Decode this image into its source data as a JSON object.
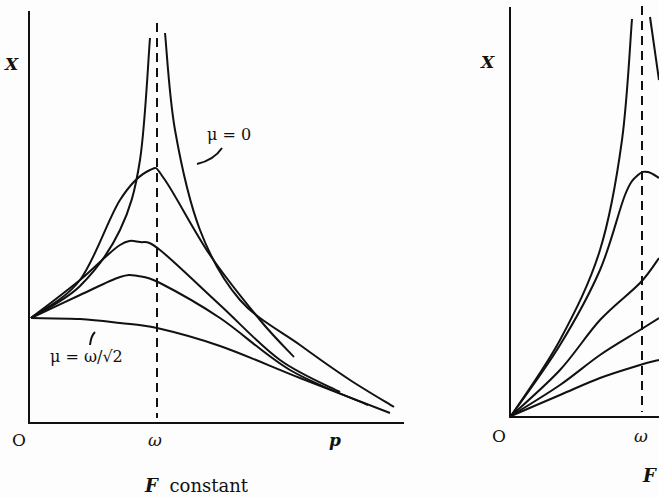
{
  "chart_data": [
    {
      "type": "line",
      "title": "",
      "caption": "F constant",
      "xlabel": "p",
      "ylabel": "X",
      "origin_label": "O",
      "x_ticks": [
        {
          "label": "ω",
          "position": "resonance"
        }
      ],
      "grid": false,
      "legend": "none",
      "annotations": [
        {
          "text": "μ = 0",
          "target": "outermost curve (undamped, diverges at p = ω)"
        },
        {
          "text": "μ = ω/√2",
          "target": "lowest curve (monotonically decreasing)"
        }
      ],
      "reference_lines": [
        {
          "type": "vertical",
          "style": "dashed",
          "at": "ω"
        }
      ],
      "series": [
        {
          "name": "μ = 0",
          "description": "diverges to infinity at p = ω; two branches",
          "points_left": [
            [
              31,
              318
            ],
            [
              80,
              286
            ],
            [
              120,
              230
            ],
            [
              140,
              160
            ],
            [
              150,
              38
            ]
          ],
          "points_right": [
            [
              165,
              33
            ],
            [
              175,
              130
            ],
            [
              200,
              230
            ],
            [
              240,
              300
            ],
            [
              300,
              345
            ],
            [
              350,
              380
            ],
            [
              394,
              407
            ]
          ]
        },
        {
          "name": "μ small",
          "points": [
            [
              31,
              318
            ],
            [
              80,
              280
            ],
            [
              120,
              200
            ],
            [
              150,
              170
            ],
            [
              165,
              180
            ],
            [
              210,
              255
            ],
            [
              260,
              320
            ],
            [
              294,
              357
            ]
          ]
        },
        {
          "name": "μ medium",
          "points": [
            [
              31,
              318
            ],
            [
              80,
              280
            ],
            [
              120,
              245
            ],
            [
              140,
              242
            ],
            [
              160,
              250
            ],
            [
              220,
              305
            ],
            [
              280,
              360
            ],
            [
              340,
              392
            ]
          ]
        },
        {
          "name": "μ larger",
          "points": [
            [
              31,
              318
            ],
            [
              80,
              295
            ],
            [
              120,
              277
            ],
            [
              138,
              276
            ],
            [
              160,
              283
            ],
            [
              220,
              318
            ],
            [
              290,
              370
            ],
            [
              368,
              405
            ]
          ]
        },
        {
          "name": "μ = ω/√2",
          "points": [
            [
              31,
              318
            ],
            [
              80,
              319
            ],
            [
              120,
              323
            ],
            [
              157,
              328
            ],
            [
              220,
              346
            ],
            [
              300,
              378
            ],
            [
              390,
              413
            ]
          ]
        }
      ]
    },
    {
      "type": "line",
      "title": "",
      "caption": "F",
      "ylabel": "X",
      "origin_label": "O",
      "x_ticks": [
        {
          "label": "ω",
          "position": "resonance"
        }
      ],
      "grid": false,
      "legend": "none",
      "reference_lines": [
        {
          "type": "vertical",
          "style": "dashed",
          "at": "ω"
        }
      ],
      "note": "Figure cropped at right edge; all curves start at origin (X = 0 at p = 0)",
      "series": [
        {
          "name": "μ = 0",
          "points_left": [
            [
              511,
              416
            ],
            [
              560,
              340
            ],
            [
              600,
              250
            ],
            [
              622,
              140
            ],
            [
              632,
              19
            ]
          ],
          "points_right": [
            [
              650,
              17
            ],
            [
              659,
              80
            ]
          ]
        },
        {
          "name": "μ small",
          "points": [
            [
              511,
              416
            ],
            [
              560,
              345
            ],
            [
              600,
              270
            ],
            [
              625,
              195
            ],
            [
              638,
              175
            ],
            [
              648,
              172
            ],
            [
              659,
              178
            ]
          ]
        },
        {
          "name": "μ medium",
          "points": [
            [
              511,
              416
            ],
            [
              560,
              370
            ],
            [
              600,
              320
            ],
            [
              640,
              283
            ],
            [
              659,
              258
            ]
          ]
        },
        {
          "name": "μ larger",
          "points": [
            [
              511,
              416
            ],
            [
              560,
              385
            ],
            [
              600,
              355
            ],
            [
              640,
              330
            ],
            [
              659,
              318
            ]
          ]
        },
        {
          "name": "μ largest",
          "points": [
            [
              511,
              416
            ],
            [
              560,
              395
            ],
            [
              600,
              378
            ],
            [
              640,
              365
            ],
            [
              659,
              360
            ]
          ]
        }
      ]
    }
  ],
  "left": {
    "y_label": "X",
    "origin": "O",
    "omega": "ω",
    "p": "p",
    "caption_f": "F",
    "caption_rest": "constant",
    "mu0_label": "μ = 0",
    "mu_sqrt_label": "μ = ω/√2"
  },
  "right": {
    "y_label": "X",
    "origin": "O",
    "omega": "ω",
    "caption_f": "F"
  }
}
